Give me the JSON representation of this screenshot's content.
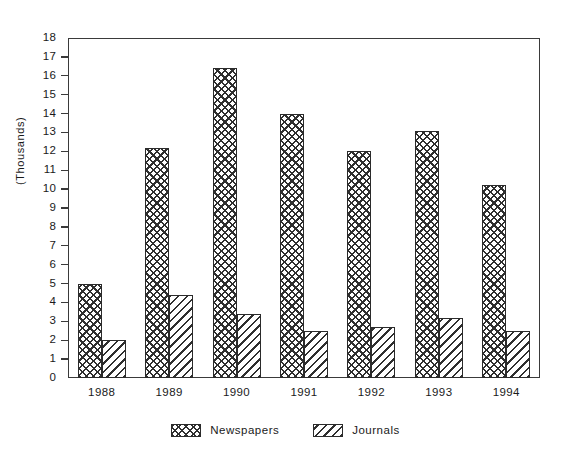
{
  "chart_data": {
    "type": "bar",
    "title": "",
    "subtitle": "",
    "xlabel": "",
    "ylabel": "(Thousands)",
    "categories": [
      "1988",
      "1989",
      "1990",
      "1991",
      "1992",
      "1993",
      "1994"
    ],
    "series": [
      {
        "name": "Newspapers",
        "pattern": "cross-hatch",
        "values": [
          5.0,
          12.2,
          16.4,
          14.0,
          12.0,
          13.1,
          10.2
        ]
      },
      {
        "name": "Journals",
        "pattern": "diagonal-hatch",
        "values": [
          2.0,
          4.4,
          3.4,
          2.5,
          2.7,
          3.2,
          2.5
        ]
      }
    ],
    "ylim": [
      0,
      18
    ],
    "yticks": [
      0,
      1,
      2,
      3,
      4,
      5,
      6,
      7,
      8,
      9,
      10,
      11,
      12,
      13,
      14,
      15,
      16,
      17,
      18
    ],
    "ytick_labels": [
      "0",
      "1",
      "2",
      "3",
      "4",
      "5",
      "6",
      "7",
      "8",
      "9",
      "10",
      "11",
      "12",
      "13",
      "14",
      "15",
      "16",
      "17",
      "18"
    ],
    "grid": false,
    "legend_position": "bottom",
    "colors": {
      "ink": "#2f2f2f",
      "axis": "#3a3a3a",
      "background": "#ffffff"
    }
  }
}
